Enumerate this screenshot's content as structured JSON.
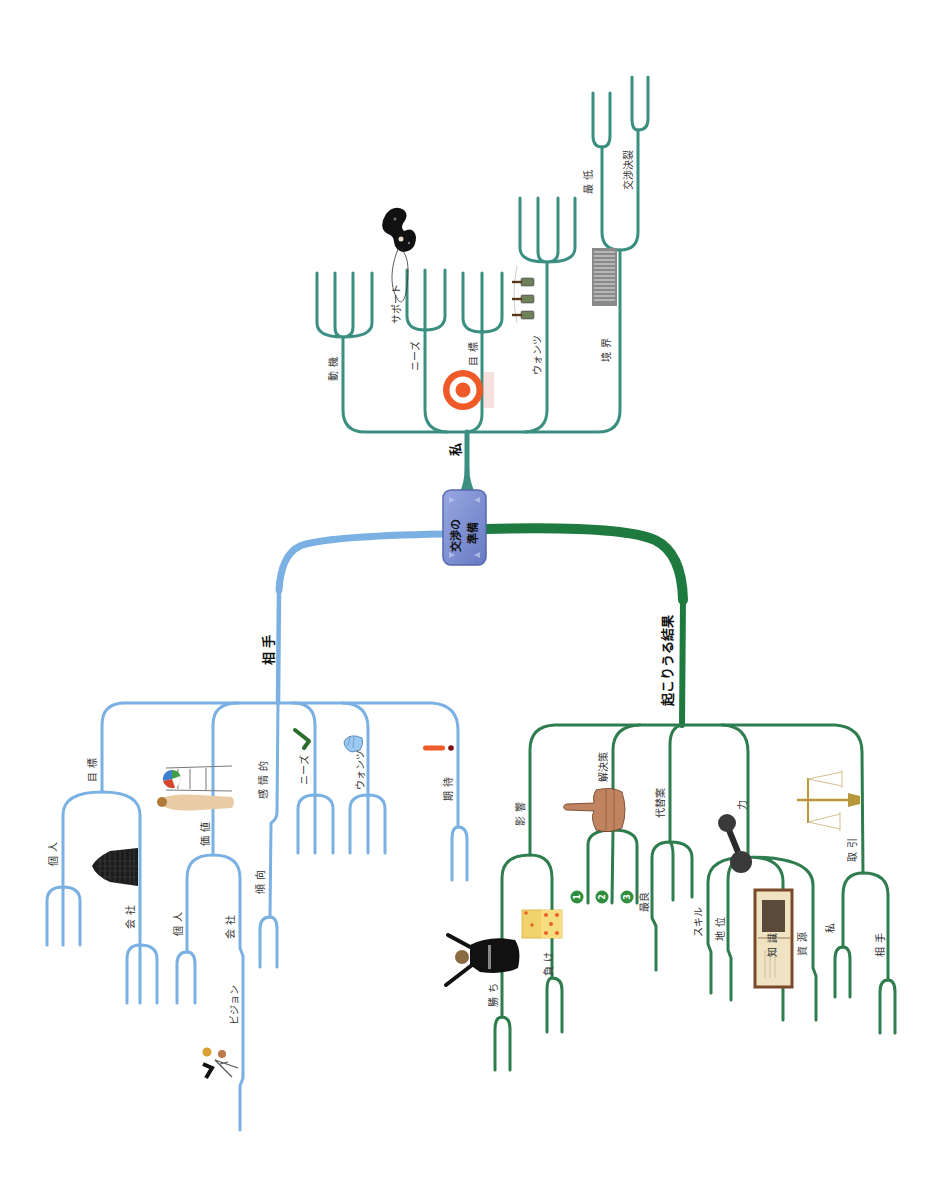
{
  "central_node": {
    "line1": "交渉の",
    "line2": "準備",
    "color": "#7c8ed3"
  },
  "branches": [
    {
      "label": "私",
      "color": "#3a8f80",
      "children": [
        {
          "label": "動機"
        },
        {
          "label": "ニーズ",
          "icon": "telephone-icon",
          "children": [
            {
              "label": "サポート"
            }
          ]
        },
        {
          "label": "目標",
          "icon": "target-icon"
        },
        {
          "label": "ウォンツ",
          "icon": "bottles-icon"
        },
        {
          "label": "境界",
          "icon": "fence-icon",
          "children": [
            {
              "label": "最低"
            },
            {
              "label": "交渉決裂"
            }
          ]
        }
      ]
    },
    {
      "label": "相手",
      "color": "#7ab0e2",
      "children": [
        {
          "label": "目標",
          "children": [
            {
              "label": "個人"
            },
            {
              "label": "会社",
              "icon": "building-icon"
            }
          ]
        },
        {
          "label": "価値",
          "icon": "presentation-icon",
          "children": [
            {
              "label": "個人"
            },
            {
              "label": "会社",
              "children": [
                {
                  "label": "ビジョン",
                  "icon": "climbers-icon"
                }
              ]
            }
          ]
        },
        {
          "label": "感情的",
          "children": [
            {
              "label": "傾向"
            }
          ]
        },
        {
          "label": "ニーズ",
          "icon": "checkmark-icon"
        },
        {
          "label": "ウォンツ",
          "icon": "pointing-hand-icon"
        },
        {
          "label": "期待",
          "icon": "exclamation-icon"
        }
      ]
    },
    {
      "label": "起こりうる結果",
      "color": "#237a45",
      "children": [
        {
          "label": "影響",
          "children": [
            {
              "label": "勝ち",
              "icon": "fallen-man-icon"
            },
            {
              "label": "負け",
              "icon": "dice-icon"
            }
          ]
        },
        {
          "label": "解決策",
          "icon": "thumb-icon",
          "children": [
            {
              "label": "1"
            },
            {
              "label": "2"
            },
            {
              "label": "3"
            }
          ]
        },
        {
          "label": "代替案",
          "children": [
            {
              "label": "最良"
            }
          ]
        },
        {
          "label": "力",
          "icon": "dumbbell-icon",
          "children": [
            {
              "label": "スキル"
            },
            {
              "label": "地位"
            },
            {
              "label": "知識",
              "icon": "book-icon"
            },
            {
              "label": "資源"
            }
          ]
        },
        {
          "label": "取引",
          "icon": "scales-icon",
          "children": [
            {
              "label": "私"
            },
            {
              "label": "相手"
            }
          ]
        }
      ]
    }
  ]
}
